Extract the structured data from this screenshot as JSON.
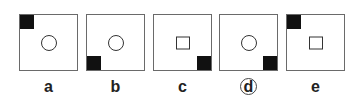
{
  "options": [
    {
      "label": "a",
      "corner": "top-left",
      "shape": "circle",
      "selected": false,
      "left": 19
    },
    {
      "label": "b",
      "corner": "bottom-left",
      "shape": "circle",
      "selected": false,
      "left": 86
    },
    {
      "label": "c",
      "corner": "bottom-right",
      "shape": "square",
      "selected": false,
      "left": 153
    },
    {
      "label": "d",
      "corner": "bottom-right",
      "shape": "circle",
      "selected": true,
      "left": 219
    },
    {
      "label": "e",
      "corner": "top-left",
      "shape": "square",
      "selected": false,
      "left": 286
    }
  ],
  "colors": {
    "corner_fill": "#111111",
    "border": "#6a6a6a",
    "background": "#ffffff"
  }
}
